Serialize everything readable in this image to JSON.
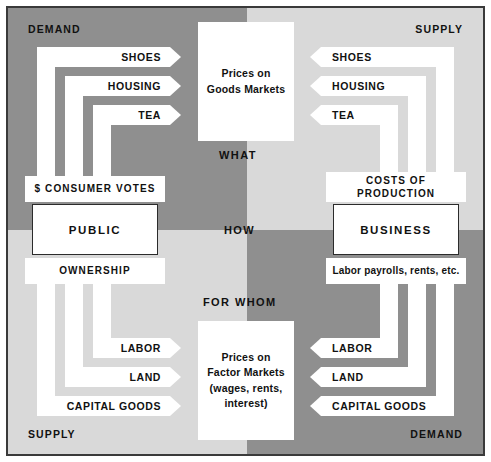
{
  "diagram": {
    "colors": {
      "quadrant_dark": "#8f8f8f",
      "quadrant_light": "#d9d9d9",
      "channel": "#ffffff",
      "text": "#111111",
      "frame": "#3a3a3a"
    }
  },
  "corner_labels": {
    "top_left": "DEMAND",
    "top_right": "SUPPLY",
    "bottom_left": "SUPPLY",
    "bottom_right": "DEMAND"
  },
  "question_labels": {
    "what": "WHAT",
    "how": "HOW",
    "for_whom": "FOR WHOM"
  },
  "markets": {
    "goods": "Prices on\nGoods Markets",
    "goods_line1": "Prices on",
    "goods_line2": "Goods Markets",
    "factor_line1": "Prices on",
    "factor_line2": "Factor Markets",
    "factor_line3": "(wages, rents,",
    "factor_line4": "interest)"
  },
  "public_group": {
    "top_band": "$ CONSUMER VOTES",
    "agent": "PUBLIC",
    "bottom_band": "OWNERSHIP"
  },
  "business_group": {
    "top_band_line1": "COSTS  OF",
    "top_band_line2": "PRODUCTION",
    "agent": "BUSINESS",
    "bottom_band": "Labor payrolls, rents, etc."
  },
  "goods_flows": {
    "left": [
      {
        "label": "SHOES",
        "direction": "right"
      },
      {
        "label": "HOUSING",
        "direction": "right"
      },
      {
        "label": "TEA",
        "direction": "right"
      }
    ],
    "right": [
      {
        "label": "SHOES",
        "direction": "left"
      },
      {
        "label": "HOUSING",
        "direction": "left"
      },
      {
        "label": "TEA",
        "direction": "left"
      }
    ]
  },
  "factor_flows": {
    "left": [
      {
        "label": "LABOR",
        "direction": "right"
      },
      {
        "label": "LAND",
        "direction": "right"
      },
      {
        "label": "CAPITAL GOODS",
        "direction": "right"
      }
    ],
    "right": [
      {
        "label": "LABOR",
        "direction": "left"
      },
      {
        "label": "LAND",
        "direction": "left"
      },
      {
        "label": "CAPITAL GOODS",
        "direction": "left"
      }
    ]
  }
}
